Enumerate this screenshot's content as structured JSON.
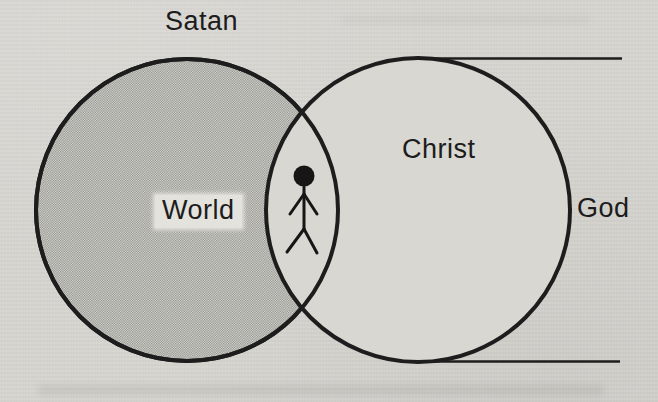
{
  "diagram": {
    "labels": {
      "satan": "Satan",
      "world": "World",
      "christ": "Christ",
      "god": "God"
    },
    "icons": {
      "person": "stick-figure-icon"
    },
    "colors": {
      "paper": "#d6d4cf",
      "ink": "#1c1c1c",
      "halftone_dark": "#8b8b87",
      "halftone_light": "#deddd8",
      "inner_circle_fill": "#d9d7d2",
      "world_label_box": "#e3e2dd"
    }
  }
}
